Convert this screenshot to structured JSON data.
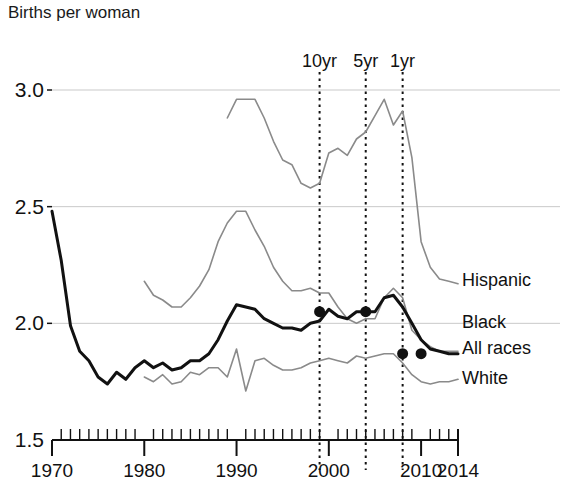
{
  "chart_data": {
    "type": "line",
    "title": "Births per woman",
    "xlabel": "",
    "ylabel": "Births per woman",
    "xlim": [
      1970,
      2014
    ],
    "ylim": [
      1.5,
      3.05
    ],
    "grid": "horizontal gridlines at 2.0, 2.5, 3.0",
    "legend_position": "right of plot, inline at series end",
    "y_ticks": [
      "1.5",
      "2.0",
      "2.5",
      "3.0"
    ],
    "y_tick_values": [
      1.5,
      2.0,
      2.5,
      3.0
    ],
    "x_ticks": [
      "1970",
      "1980",
      "1990",
      "2000",
      "2010",
      "2014"
    ],
    "x_tick_values": [
      1970,
      1980,
      1990,
      2000,
      2010,
      2014
    ],
    "x_minor_tick_step": 1,
    "annotations": [
      {
        "label": "10yr",
        "x": 1999,
        "style": "vertical dotted line"
      },
      {
        "label": "5yr",
        "x": 2004,
        "style": "vertical dotted line"
      },
      {
        "label": "1yr",
        "x": 2008,
        "style": "vertical dotted line"
      }
    ],
    "markers": [
      {
        "series": "All races",
        "x": 1999,
        "y": 2.05
      },
      {
        "series": "All races",
        "x": 2004,
        "y": 2.05
      },
      {
        "series": "All races",
        "x": 2008,
        "y": 1.87
      },
      {
        "series": "All races",
        "x": 2010,
        "y": 1.87
      }
    ],
    "series": [
      {
        "name": "Hispanic",
        "color": "#8a8a8a",
        "width": 1.6,
        "label_y": 2.18,
        "x": [
          1989,
          1990,
          1991,
          1992,
          1993,
          1994,
          1995,
          1996,
          1997,
          1998,
          1999,
          2000,
          2001,
          2002,
          2003,
          2004,
          2005,
          2006,
          2007,
          2008,
          2009,
          2010,
          2011,
          2012,
          2013,
          2014
        ],
        "values": [
          2.88,
          2.96,
          2.96,
          2.96,
          2.88,
          2.78,
          2.7,
          2.68,
          2.6,
          2.58,
          2.6,
          2.73,
          2.75,
          2.72,
          2.79,
          2.82,
          2.89,
          2.96,
          2.85,
          2.91,
          2.71,
          2.35,
          2.24,
          2.19,
          2.18,
          2.17
        ]
      },
      {
        "name": "Black",
        "color": "#8a8a8a",
        "width": 1.6,
        "label_y": 2.0,
        "x": [
          1980,
          1981,
          1982,
          1983,
          1984,
          1985,
          1986,
          1987,
          1988,
          1989,
          1990,
          1991,
          1992,
          1993,
          1994,
          1995,
          1996,
          1997,
          1998,
          1999,
          2000,
          2001,
          2002,
          2003,
          2004,
          2005,
          2006,
          2007,
          2008,
          2009,
          2010,
          2011,
          2012,
          2013,
          2014
        ],
        "values": [
          2.18,
          2.12,
          2.1,
          2.07,
          2.07,
          2.11,
          2.16,
          2.23,
          2.35,
          2.43,
          2.48,
          2.48,
          2.4,
          2.33,
          2.24,
          2.18,
          2.14,
          2.14,
          2.15,
          2.13,
          2.13,
          2.07,
          2.02,
          2.0,
          2.02,
          2.02,
          2.11,
          2.15,
          2.11,
          1.97,
          1.93,
          1.9,
          1.88,
          1.88,
          1.88
        ]
      },
      {
        "name": "All races",
        "color": "#111111",
        "width": 3.0,
        "label_y": 1.89,
        "x": [
          1970,
          1971,
          1972,
          1973,
          1974,
          1975,
          1976,
          1977,
          1978,
          1979,
          1980,
          1981,
          1982,
          1983,
          1984,
          1985,
          1986,
          1987,
          1988,
          1989,
          1990,
          1991,
          1992,
          1993,
          1994,
          1995,
          1996,
          1997,
          1998,
          1999,
          2000,
          2001,
          2002,
          2003,
          2004,
          2005,
          2006,
          2007,
          2008,
          2009,
          2010,
          2011,
          2012,
          2013,
          2014
        ],
        "values": [
          2.48,
          2.27,
          1.99,
          1.88,
          1.84,
          1.77,
          1.74,
          1.79,
          1.76,
          1.81,
          1.84,
          1.81,
          1.83,
          1.8,
          1.81,
          1.84,
          1.84,
          1.87,
          1.93,
          2.01,
          2.08,
          2.07,
          2.06,
          2.02,
          2.0,
          1.98,
          1.98,
          1.97,
          2.0,
          2.01,
          2.06,
          2.03,
          2.02,
          2.05,
          2.05,
          2.05,
          2.11,
          2.12,
          2.07,
          2.0,
          1.93,
          1.89,
          1.88,
          1.87,
          1.87
        ]
      },
      {
        "name": "White",
        "color": "#8a8a8a",
        "width": 1.6,
        "label_y": 1.76,
        "x": [
          1980,
          1981,
          1982,
          1983,
          1984,
          1985,
          1986,
          1987,
          1988,
          1989,
          1990,
          1991,
          1992,
          1993,
          1994,
          1995,
          1996,
          1997,
          1998,
          1999,
          2000,
          2001,
          2002,
          2003,
          2004,
          2005,
          2006,
          2007,
          2008,
          2009,
          2010,
          2011,
          2012,
          2013,
          2014
        ],
        "values": [
          1.77,
          1.75,
          1.78,
          1.74,
          1.75,
          1.79,
          1.78,
          1.81,
          1.81,
          1.77,
          1.89,
          1.71,
          1.84,
          1.85,
          1.82,
          1.8,
          1.8,
          1.81,
          1.83,
          1.84,
          1.85,
          1.84,
          1.83,
          1.86,
          1.85,
          1.86,
          1.87,
          1.87,
          1.83,
          1.78,
          1.75,
          1.74,
          1.75,
          1.75,
          1.76
        ]
      }
    ]
  },
  "labels": {
    "title": "Births per woman",
    "annotations": [
      "10yr",
      "5yr",
      "1yr"
    ],
    "series_names": [
      "Hispanic",
      "Black",
      "All races",
      "White"
    ],
    "y_ticks": [
      "3.0",
      "2.5",
      "2.0",
      "1.5"
    ],
    "x_ticks": [
      "1970",
      "1980",
      "1990",
      "2000",
      "2010",
      "2014"
    ]
  }
}
